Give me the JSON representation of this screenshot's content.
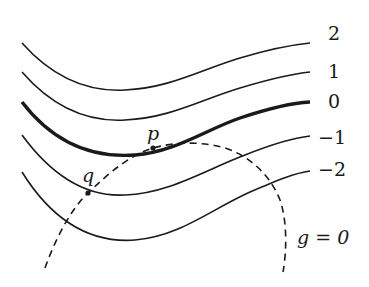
{
  "diagram": {
    "type": "level-curves-with-constraint",
    "level_labels": [
      "2",
      "1",
      "0",
      "−1",
      "−2"
    ],
    "highlighted_level": "0",
    "points": [
      {
        "name": "p",
        "label": "p"
      },
      {
        "name": "q",
        "label": "q"
      }
    ],
    "constraint_label": "g = 0",
    "colors": {
      "stroke": "#1a1a1a",
      "background": "#ffffff"
    }
  }
}
